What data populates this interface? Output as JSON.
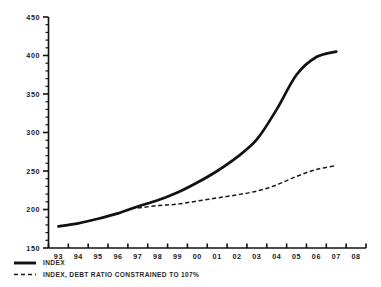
{
  "chart_data": {
    "type": "line",
    "title": "",
    "subtitle": "",
    "xlabel": "",
    "ylabel": "",
    "ylim": [
      150,
      450
    ],
    "y_ticks": [
      150,
      200,
      250,
      300,
      350,
      400,
      450
    ],
    "y_tick_labels": [
      "150",
      "200",
      "250",
      "300",
      "350",
      "400",
      "450"
    ],
    "y_minor_step": 10,
    "grid": false,
    "legend_position": "below-left",
    "categories": [
      "93",
      "94",
      "95",
      "96",
      "97",
      "98",
      "99",
      "00",
      "01",
      "02",
      "03",
      "04",
      "05",
      "06",
      "07",
      "08"
    ],
    "x": [
      "93",
      "94",
      "95",
      "96",
      "97",
      "98",
      "99",
      "00",
      "01",
      "02",
      "03",
      "04",
      "05",
      "06",
      "07",
      "08"
    ],
    "series": [
      {
        "name": "INDEX",
        "style": "solid",
        "color": "#111111",
        "x": [
          "93",
          "94",
          "95",
          "96",
          "97",
          "98",
          "99",
          "00",
          "01",
          "02",
          "03",
          "04",
          "05",
          "06",
          "07"
        ],
        "values": [
          178,
          182,
          188,
          195,
          204,
          212,
          222,
          235,
          250,
          268,
          291,
          330,
          375,
          398,
          405
        ]
      },
      {
        "name": "INDEX, DEBT RATIO CONSTRAINED TO 107%",
        "style": "dashed",
        "color": "#1a1a1a",
        "x": [
          "97",
          "98",
          "99",
          "00",
          "01",
          "02",
          "03",
          "04",
          "05",
          "06",
          "07"
        ],
        "values": [
          202,
          205,
          207,
          211,
          215,
          219,
          224,
          232,
          243,
          252,
          257
        ]
      }
    ],
    "legend": [
      {
        "label": "INDEX",
        "style": "solid"
      },
      {
        "label": "INDEX, DEBT RATIO CONSTRAINED TO 107%",
        "style": "dashed"
      }
    ],
    "colors": {
      "background": "#ffffff",
      "axis": "#111111",
      "series_index": "#111111",
      "series_constrained": "#1a1a1a",
      "text": "#1a1a1a"
    }
  }
}
